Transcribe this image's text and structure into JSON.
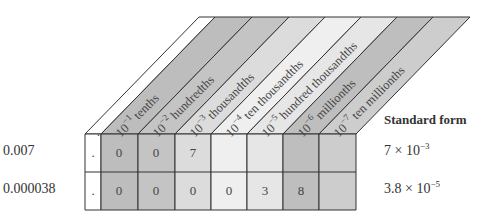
{
  "columns": [
    {
      "label": "10",
      "exp": "−1",
      "name": "tenths",
      "fill": "#bdbdbd"
    },
    {
      "label": "10",
      "exp": "−2",
      "name": "hundredths",
      "fill": "#c4c4c4"
    },
    {
      "label": "10",
      "exp": "−3",
      "name": "thousandths",
      "fill": "#dcdcdc"
    },
    {
      "label": "10",
      "exp": "−4",
      "name": "ten thousandths",
      "fill": "#efefef"
    },
    {
      "label": "10",
      "exp": "−5",
      "name": "hundred thousandths",
      "fill": "#e6e6e6"
    },
    {
      "label": "10",
      "exp": "−6",
      "name": "millionths",
      "fill": "#bebebe"
    },
    {
      "label": "10",
      "exp": "−7",
      "name": "ten millionths",
      "fill": "#cdcdcd"
    }
  ],
  "decimal_point": ".",
  "header": {
    "standard_form": "Standard form"
  },
  "rows": [
    {
      "number": "0.007",
      "digits": [
        "0",
        "0",
        "7",
        "",
        "",
        "",
        ""
      ],
      "standard_mantissa": "7 × 10",
      "standard_exp": "−3"
    },
    {
      "number": "0.000038",
      "digits": [
        "0",
        "0",
        "0",
        "0",
        "3",
        "8",
        ""
      ],
      "standard_mantissa": "3.8 × 10",
      "standard_exp": "−5"
    }
  ]
}
